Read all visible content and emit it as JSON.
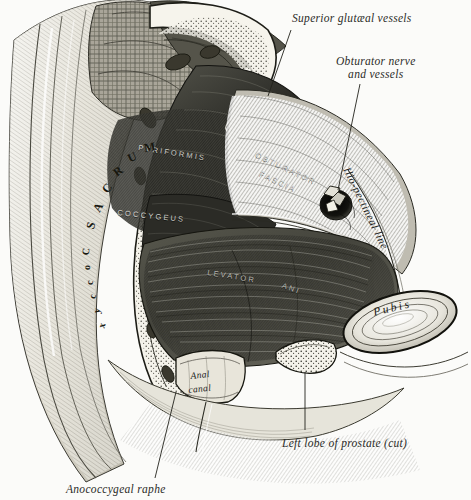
{
  "plate": {
    "title": "Coronal/oblique section of the male pelvic floor",
    "background_color": "#fbfbf9",
    "ink_color": "#2b2b28"
  },
  "callouts": [
    {
      "id": "superior-gluteal-vessels",
      "text": "Superior glutæal vessels"
    },
    {
      "id": "obturator-nerve-and-vessels",
      "line1": "Obturator nerve",
      "line2": "and vessels"
    },
    {
      "id": "left-lobe-of-prostate",
      "text": "Left lobe of prostate (cut)"
    },
    {
      "id": "anococcygeal-raphe",
      "text": "Anococcygeal raphe"
    }
  ],
  "figure_labels": {
    "sacrum": "SACRUM",
    "sacrum_letters": [
      "S",
      "A",
      "C",
      "R",
      "U",
      "M"
    ],
    "coccyx": "Coccyx",
    "coccyx_letters": [
      "C",
      "o",
      "c",
      "c",
      "y",
      "x"
    ],
    "pyriformis": "PYRIFORMIS",
    "coccygeus": "COCCYGEUS",
    "levator": "LEVATOR",
    "ani": "ANI",
    "obturator_fascia_line1": "OBTURATOR",
    "obturator_fascia_line2": "FASCIA",
    "ilio_pectineal_line": "Ilio-pectineal line",
    "pubis": "Pubis",
    "anal_canal_line1": "Anal",
    "anal_canal_line2": "canal"
  },
  "colors": {
    "bone": "#f2f0e8",
    "muscle_dark": "#3a3a34",
    "muscle_mid": "#6b6b61",
    "fascia": "#8f8f85",
    "skin": "#d8d6cc",
    "fat": "#9a968a",
    "outline": "#1a1a16"
  }
}
